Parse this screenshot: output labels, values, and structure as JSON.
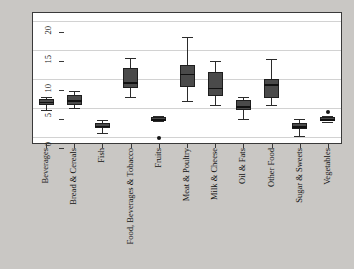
{
  "chart_data": {
    "type": "box",
    "title": "",
    "xlabel": "",
    "ylabel": "",
    "ylim": [
      -1.5,
      21
    ],
    "yticks": [
      0,
      5,
      10,
      15,
      20
    ],
    "ytick_labels": [
      "0",
      "5",
      "10",
      "15",
      "20"
    ],
    "grid": true,
    "legend": "none",
    "categories": [
      "Beverages",
      "Bread & Cereals",
      "Fish",
      "Food, Beverages & Tobacco",
      "Fruits",
      "Meat & Poultry",
      "Milk & Cheese",
      "Oil & Fats",
      "Other Food",
      "Sugar & Sweets",
      "Vegetables"
    ],
    "boxes": [
      {
        "category": "Beverages",
        "whisker_low": 4.4,
        "q1": 5.4,
        "median": 5.9,
        "q3": 6.4,
        "whisker_high": 6.8,
        "outliers": []
      },
      {
        "category": "Bread & Cereals",
        "whisker_low": 4.8,
        "q1": 5.3,
        "median": 6.2,
        "q3": 7.1,
        "whisker_high": 7.7,
        "outliers": []
      },
      {
        "category": "Fish",
        "whisker_low": 0.6,
        "q1": 1.3,
        "median": 1.8,
        "q3": 2.2,
        "whisker_high": 2.8,
        "outliers": []
      },
      {
        "category": "Food, Beverages & Tobacco",
        "whisker_low": 6.8,
        "q1": 8.2,
        "median": 9.3,
        "q3": 11.8,
        "whisker_high": 13.5,
        "outliers": []
      },
      {
        "category": "Fruits",
        "whisker_low": 2.6,
        "q1": 2.7,
        "median": 2.9,
        "q3": 3.2,
        "whisker_high": 3.4,
        "outliers": [
          -0.4
        ]
      },
      {
        "category": "Meat & Poultry",
        "whisker_low": 6.0,
        "q1": 8.5,
        "median": 10.7,
        "q3": 12.3,
        "whisker_high": 17.0,
        "outliers": []
      },
      {
        "category": "Milk & Cheese",
        "whisker_low": 5.4,
        "q1": 6.9,
        "median": 8.3,
        "q3": 11.0,
        "whisker_high": 13.0,
        "outliers": []
      },
      {
        "category": "Oil & Fats",
        "whisker_low": 2.9,
        "q1": 4.4,
        "median": 5.1,
        "q3": 6.2,
        "whisker_high": 6.7,
        "outliers": []
      },
      {
        "category": "Other Food",
        "whisker_low": 5.3,
        "q1": 6.6,
        "median": 8.9,
        "q3": 9.8,
        "whisker_high": 13.2,
        "outliers": []
      },
      {
        "category": "Sugar & Sweets",
        "whisker_low": 0.0,
        "q1": 1.2,
        "median": 1.7,
        "q3": 2.3,
        "whisker_high": 3.0,
        "outliers": []
      },
      {
        "category": "Vegetables",
        "whisker_low": 2.5,
        "q1": 2.7,
        "median": 2.9,
        "q3": 3.2,
        "whisker_high": 3.4,
        "outliers": [
          4.2
        ]
      }
    ],
    "colors": {
      "box_fill": "#4a4a4a",
      "box_edge": "#1e1e1e",
      "median": "#111111",
      "whisker": "#2b2b2b",
      "outlier": "#161616",
      "grid": "#d2d2d2",
      "plot_background": "#ffffff",
      "figure_background": "#c9c7c4",
      "axis": "#3a3a3a",
      "text": "#121212"
    }
  }
}
